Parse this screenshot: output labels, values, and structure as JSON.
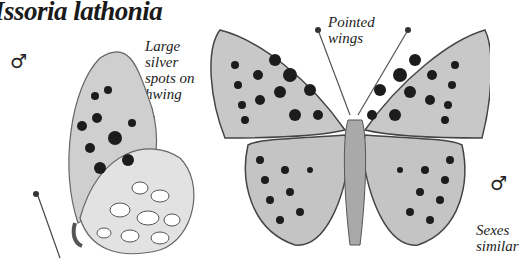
{
  "title": "Issoria lathonia",
  "labels": {
    "large_silver_spots": [
      "Large",
      "silver",
      "spots on",
      "hwing"
    ],
    "pointed_wings": [
      "Pointed",
      "wings"
    ],
    "sexes_similar": [
      "Sexes",
      "similar"
    ]
  },
  "symbols": {
    "male_left": "♂",
    "male_right": "♂"
  },
  "colors": {
    "wing_base": "#c9c9c9",
    "spot": "#1c1c1c",
    "text": "#222222",
    "background": "#ffffff"
  }
}
